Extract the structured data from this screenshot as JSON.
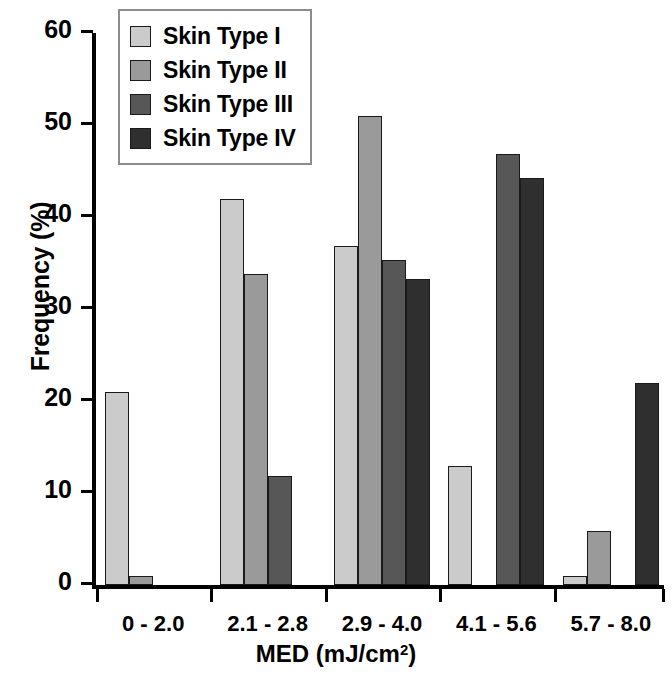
{
  "chart_data": {
    "type": "bar",
    "title": "",
    "xlabel": "MED  (mJ/cm²)",
    "ylabel": "Frequency (%)",
    "categories": [
      "0 - 2.0",
      "2.1 - 2.8",
      "2.9 - 4.0",
      "4.1 - 5.6",
      "5.7 - 8.0"
    ],
    "series": [
      {
        "name": "Skin Type I",
        "color": "#cbcbcb",
        "values": [
          21,
          42,
          36.8,
          12.9,
          1
        ]
      },
      {
        "name": "Skin Type II",
        "color": "#9a9a9a",
        "values": [
          1,
          33.8,
          51,
          0,
          5.9
        ]
      },
      {
        "name": "Skin Type III",
        "color": "#575757",
        "values": [
          0,
          11.9,
          35.3,
          46.8,
          0
        ]
      },
      {
        "name": "Skin Type IV",
        "color": "#2f2f2f",
        "values": [
          0,
          0,
          33.3,
          44.2,
          22
        ]
      }
    ],
    "ylim": [
      0,
      60
    ],
    "yticks": [
      0,
      10,
      20,
      30,
      40,
      50,
      60
    ],
    "ytick_labels": [
      "0",
      "10",
      "20",
      "30",
      "40",
      "50",
      "60"
    ],
    "grid": false,
    "legend_position": "top-left",
    "legend_entries": [
      "Skin Type I",
      "Skin Type II",
      "Skin Type III",
      "Skin Type IV"
    ]
  }
}
